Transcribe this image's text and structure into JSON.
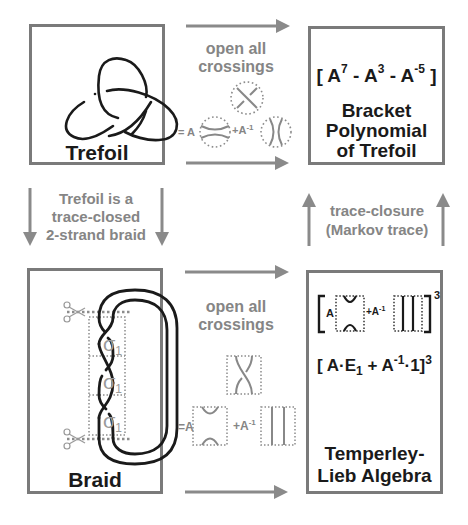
{
  "boxes": {
    "trefoil": {
      "title": "Trefoil"
    },
    "bracket": {
      "formula": {
        "open": "[",
        "A": "A",
        "exp1": "7",
        "minus1": " - ",
        "exp2": "3",
        "minus2": " - ",
        "exp3": "-5",
        "close": "]"
      },
      "title_lines": [
        "Bracket",
        "Polynomial",
        "of Trefoil"
      ]
    },
    "braid": {
      "title": "Braid",
      "generators": [
        "σ",
        "σ",
        "σ"
      ],
      "generator_subscript": "1"
    },
    "temperley_lieb": {
      "formula1": {
        "coef_a": "A",
        "plus": "+A",
        "exp_inv": "-1",
        "power": "3"
      },
      "formula2": {
        "open": "[",
        "A": "A",
        "dot": "·",
        "E": "E",
        "E_sub": "1",
        "plus": " + ",
        "A2": "A",
        "exp_inv": "-1",
        "dot2": "·",
        "one": "1",
        "close": "]",
        "power": "3"
      },
      "title_lines": [
        "Temperley-",
        "Lieb Algebra"
      ]
    }
  },
  "arrows": {
    "top_label": [
      "open all",
      "crossings"
    ],
    "top_expansion": {
      "eq": "= A",
      "plus": "+A",
      "exp": "-1"
    },
    "left_label": [
      "Trefoil is a",
      "trace-closed",
      "2-strand braid"
    ],
    "right_label": [
      "trace-closure",
      "(Markov trace)"
    ],
    "bottom_label": [
      "open all",
      "crossings"
    ],
    "bottom_expansion": {
      "eq": "=A",
      "plus": "+A",
      "exp": "-1"
    }
  },
  "colors": {
    "box_border": "#7a7a7a",
    "arrow": "#8a8a8a",
    "gray_text": "#858585",
    "ink": "#1a1a1a",
    "dotted": "#8c8c8c"
  }
}
